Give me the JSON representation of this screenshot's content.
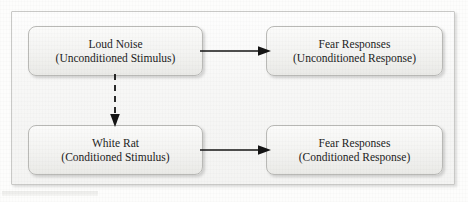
{
  "diagram": {
    "background_color": "#fdfdfc",
    "frame_color": "#c9c9c7",
    "frame_fill": "#f7f7f6",
    "node_border_color": "#b9b9b6",
    "node_fill": "#f3f3f1",
    "text_color": "#1c1c1c",
    "arrow_color": "#141414",
    "nodes": [
      {
        "id": "unconditioned-stimulus",
        "label": "Loud Noise",
        "sublabel": "(Unconditioned Stimulus)"
      },
      {
        "id": "unconditioned-response",
        "label": "Fear Responses",
        "sublabel": "(Unconditioned Response)"
      },
      {
        "id": "conditioned-stimulus",
        "label": "White Rat",
        "sublabel": "(Conditioned Stimulus)"
      },
      {
        "id": "conditioned-response",
        "label": "Fear Responses",
        "sublabel": "(Conditioned Response)"
      }
    ],
    "connectors": [
      {
        "id": "us-to-ur",
        "from": "unconditioned-stimulus",
        "to": "unconditioned-response",
        "style": "solid",
        "direction": "right",
        "icon": "arrow-right-icon"
      },
      {
        "id": "cs-to-cr",
        "from": "conditioned-stimulus",
        "to": "conditioned-response",
        "style": "solid",
        "direction": "right",
        "icon": "arrow-right-icon"
      },
      {
        "id": "us-to-cs",
        "from": "unconditioned-stimulus",
        "to": "conditioned-stimulus",
        "style": "dashed",
        "direction": "down",
        "icon": "arrow-down-dashed-icon"
      }
    ]
  }
}
